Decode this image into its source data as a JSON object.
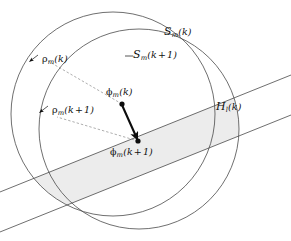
{
  "figure": {
    "type": "geometric-diagram",
    "background_color": "#ffffff",
    "stroke_color": "#4a4a4a",
    "band_fill_color": "#ececec",
    "vector_color": "#0d0d0d"
  },
  "labels": {
    "set_outer": {
      "symbol": "S",
      "subscript": "m",
      "argument": "(k)",
      "text": "S_m(k)"
    },
    "set_inner": {
      "symbol": "S",
      "subscript": "m",
      "argument": "(k + 1)",
      "text": "S_m(k+1)"
    },
    "radius_outer": {
      "symbol": "ρ",
      "subscript": "m",
      "argument": "(k)",
      "text": "ρ_m(k)"
    },
    "radius_inner": {
      "symbol": "ρ",
      "subscript": "m",
      "argument": "(k + 1)",
      "text": "ρ_m(k+1)"
    },
    "center_old": {
      "symbol": "ϕ",
      "subscript": "m",
      "argument": "(k)",
      "text": "ϕ_m(k)"
    },
    "center_new": {
      "symbol": "ϕ",
      "subscript": "m",
      "argument": "(k + 1)",
      "text": "ϕ_m(k+1)"
    },
    "halfspace": {
      "symbol": "H",
      "subscript": "l",
      "argument": "(k)",
      "text": "H_l(k)"
    }
  },
  "geometry": {
    "circle_outer": {
      "cx": 113,
      "cy": 114,
      "r": 102,
      "name": "S_m(k)"
    },
    "circle_inner": {
      "cx": 139,
      "cy": 129,
      "r": 100,
      "name": "S_m(k+1)"
    },
    "center_old_point": {
      "x": 122,
      "y": 104
    },
    "center_new_point": {
      "x": 138,
      "y": 141
    },
    "strip_upper_line": {
      "x1": -10,
      "y1": 196,
      "x2": 301,
      "y2": 71
    },
    "strip_lower_line": {
      "x1": -10,
      "y1": 236,
      "x2": 301,
      "y2": 111
    }
  }
}
